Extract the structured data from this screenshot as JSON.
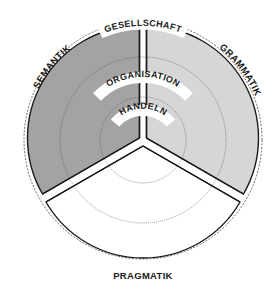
{
  "diagram": {
    "type": "three-sector circle diagram",
    "center": [
      143,
      140
    ],
    "sectors": [
      {
        "id": "semantik",
        "label": "SEMANTIK",
        "fill": "#a3a3a3",
        "position": "upper-left"
      },
      {
        "id": "grammatik",
        "label": "GRAMMATIK",
        "fill": "#d6d6d6",
        "position": "upper-right"
      },
      {
        "id": "pragmatik",
        "label": "PRAGMATIK",
        "fill": "#ffffff",
        "position": "bottom"
      }
    ],
    "levels": [
      {
        "id": "gesellschaft",
        "label": "GESELLSCHAFT",
        "ring": "outer"
      },
      {
        "id": "organisation",
        "label": "ORGANISATION",
        "ring": "middle"
      },
      {
        "id": "handeln",
        "label": "HANDELN",
        "ring": "inner"
      }
    ],
    "colors": {
      "stroke": "#1a1a1a",
      "dotted_circle": "#555555",
      "label_bg": "#ffffff"
    }
  }
}
